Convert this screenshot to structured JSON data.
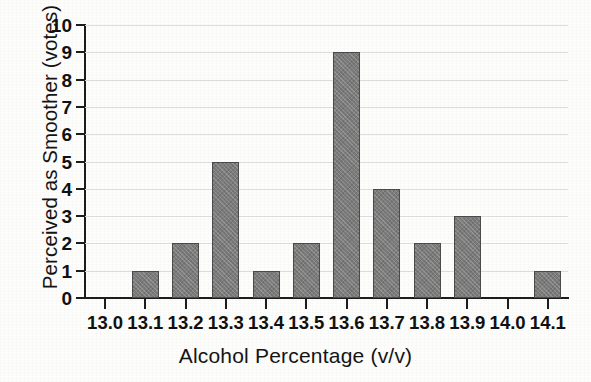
{
  "chart_data": {
    "type": "bar",
    "title": "",
    "xlabel": "Alcohol Percentage (v/v)",
    "ylabel": "Perceived as Smoother (votes)",
    "categories": [
      "13.0",
      "13.1",
      "13.2",
      "13.3",
      "13.4",
      "13.5",
      "13.6",
      "13.7",
      "13.8",
      "13.9",
      "14.0",
      "14.1"
    ],
    "values": [
      0,
      1,
      2,
      5,
      1,
      2,
      9,
      4,
      2,
      3,
      0,
      1
    ],
    "ylim": [
      0,
      10
    ],
    "ytick_labels": [
      "10",
      "9",
      "8",
      "7",
      "6",
      "5",
      "4",
      "3",
      "2",
      "1",
      "0"
    ],
    "ytick_values": [
      10,
      9,
      8,
      7,
      6,
      5,
      4,
      3,
      2,
      1,
      0
    ],
    "grid": "horizontal",
    "legend": "none",
    "bar_color": "#7b7b7b",
    "bar_edge_color": "#4a4a4a",
    "axis_color": "#1c1c1c",
    "gridline_color": "#dcdcdc",
    "background_color": "#fdfdfc"
  }
}
